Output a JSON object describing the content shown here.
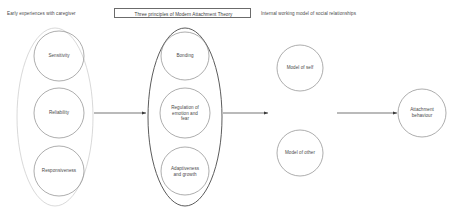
{
  "diagram": {
    "background_color": "#ffffff",
    "stroke_color": "#6b6b6b",
    "text_color": "#4a4a4a"
  },
  "headings": {
    "left": "Early experiences with caregiver",
    "middle": "Three principles of Modern Attachment Theory",
    "right": "Internal working model of social relationships"
  },
  "groups": {
    "left_group_name": "Early experiences with caregiver group",
    "middle_group_name": "Three principles group"
  },
  "nodes": {
    "left": [
      {
        "id": "sensitivity",
        "label": "Sensitivity",
        "lines": [
          "Sensitivity"
        ]
      },
      {
        "id": "reliability",
        "label": "Reliability",
        "lines": [
          "Reliability"
        ]
      },
      {
        "id": "responsiveness",
        "label": "Responsiveness",
        "lines": [
          "Responsiveness"
        ]
      }
    ],
    "middle": [
      {
        "id": "bonding",
        "label": "Bonding",
        "lines": [
          "Bonding"
        ]
      },
      {
        "id": "regulation",
        "label": "Regulation of emotion and fear",
        "lines": [
          "Regulation of",
          "emotion and",
          "fear"
        ]
      },
      {
        "id": "adaptiveness",
        "label": "Adaptiveness and growth",
        "lines": [
          "Adaptiveness",
          "and growth"
        ]
      }
    ],
    "right": [
      {
        "id": "model-of-self",
        "label": "Model of self",
        "lines": [
          "Model of self"
        ]
      },
      {
        "id": "model-of-other",
        "label": "Model of other",
        "lines": [
          "Model of other"
        ]
      }
    ],
    "outcome": {
      "id": "attachment-behaviour",
      "label": "Attachment behaviour",
      "lines": [
        "Attachment",
        "behaviour"
      ]
    }
  },
  "arrows": [
    {
      "id": "arrow-1",
      "from": "left-group",
      "to": "middle-group"
    },
    {
      "id": "arrow-2",
      "from": "middle-group",
      "to": "internal-working-model"
    },
    {
      "id": "arrow-3",
      "from": "internal-working-model",
      "to": "attachment-behaviour"
    }
  ]
}
